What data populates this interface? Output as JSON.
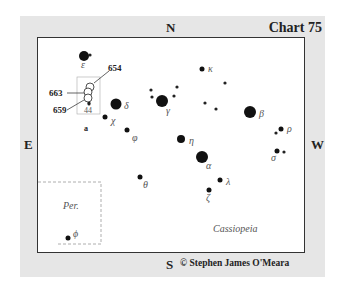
{
  "chart": {
    "title": "Chart 75",
    "copyright": "© Stephen James O'Meara",
    "directions": {
      "north": "N",
      "south": "S",
      "east": "E",
      "west": "W"
    },
    "constellation_label": "Cassiopeia",
    "inset_label": "Per.",
    "field_label": "a",
    "callouts": [
      "654",
      "663",
      "659",
      "44"
    ]
  },
  "stars": [
    {
      "name": "epsilon",
      "label": "ε",
      "x": 84,
      "y": 56,
      "r": 5
    },
    {
      "name": "delta",
      "label": "δ",
      "x": 116,
      "y": 104,
      "r": 5.5
    },
    {
      "name": "chi",
      "label": "χ",
      "x": 105,
      "y": 117,
      "r": 2.5
    },
    {
      "name": "phi",
      "label": "φ",
      "x": 127,
      "y": 130,
      "r": 2.5
    },
    {
      "name": "gamma",
      "label": "γ",
      "x": 162,
      "y": 101,
      "r": 6
    },
    {
      "name": "kappa",
      "label": "κ",
      "x": 202,
      "y": 69,
      "r": 2.5
    },
    {
      "name": "eta",
      "label": "η",
      "x": 181,
      "y": 139,
      "r": 4
    },
    {
      "name": "alpha",
      "label": "α",
      "x": 202,
      "y": 157,
      "r": 6
    },
    {
      "name": "lambda",
      "label": "λ",
      "x": 220,
      "y": 180,
      "r": 2.5
    },
    {
      "name": "zeta",
      "label": "ζ",
      "x": 209,
      "y": 190,
      "r": 2.5
    },
    {
      "name": "theta",
      "label": "θ",
      "x": 140,
      "y": 177,
      "r": 2.5
    },
    {
      "name": "beta",
      "label": "β",
      "x": 250,
      "y": 112,
      "r": 6
    },
    {
      "name": "rho",
      "label": "ρ",
      "x": 281,
      "y": 129,
      "r": 2.5
    },
    {
      "name": "sigma",
      "label": "σ",
      "x": 277,
      "y": 151,
      "r": 2.5
    },
    {
      "name": "phi-per",
      "label": "ϕ",
      "x": 68,
      "y": 238,
      "r": 2.5
    }
  ],
  "faint_stars": [
    {
      "x": 90,
      "y": 55
    },
    {
      "x": 151,
      "y": 90
    },
    {
      "x": 152,
      "y": 97
    },
    {
      "x": 174,
      "y": 96
    },
    {
      "x": 177,
      "y": 87
    },
    {
      "x": 225,
      "y": 83
    },
    {
      "x": 205,
      "y": 103
    },
    {
      "x": 216,
      "y": 109
    },
    {
      "x": 276,
      "y": 133
    },
    {
      "x": 284,
      "y": 152
    },
    {
      "x": 89,
      "y": 103
    }
  ],
  "cluster_circles": [
    {
      "x": 90,
      "y": 87,
      "r": 4
    },
    {
      "x": 88,
      "y": 92,
      "r": 4
    },
    {
      "x": 88,
      "y": 98,
      "r": 4
    }
  ]
}
